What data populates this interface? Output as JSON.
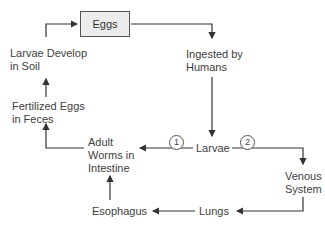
{
  "diagram": {
    "type": "life-cycle-flowchart",
    "nodes": {
      "eggs": "Eggs",
      "ingested_line1": "Ingested by",
      "ingested_line2": "Humans",
      "larvae": "Larvae",
      "venous_line1": "Venous",
      "venous_line2": "System",
      "lungs": "Lungs",
      "esophagus": "Esophagus",
      "adult_line1": "Adult",
      "adult_line2": "Worms in",
      "adult_line3": "Intestine",
      "fertilized_line1": "Fertilized Eggs",
      "fertilized_line2": "in Feces",
      "larvae_soil_line1": "Larvae Develop",
      "larvae_soil_line2": "in Soil"
    },
    "path_labels": {
      "path1": "1",
      "path2": "2"
    },
    "edges": [
      {
        "from": "Eggs",
        "to": "Ingested by Humans"
      },
      {
        "from": "Ingested by Humans",
        "to": "Larvae"
      },
      {
        "from": "Larvae",
        "to": "Adult Worms in Intestine",
        "label": "1"
      },
      {
        "from": "Larvae",
        "to": "Venous System",
        "label": "2"
      },
      {
        "from": "Venous System",
        "to": "Lungs"
      },
      {
        "from": "Lungs",
        "to": "Esophagus"
      },
      {
        "from": "Esophagus",
        "to": "Adult Worms in Intestine"
      },
      {
        "from": "Adult Worms in Intestine",
        "to": "Fertilized Eggs in Feces"
      },
      {
        "from": "Fertilized Eggs in Feces",
        "to": "Larvae Develop in Soil"
      },
      {
        "from": "Larvae Develop in Soil",
        "to": "Eggs"
      }
    ],
    "colors": {
      "box_fill": "#ececec",
      "line": "#333333",
      "text": "#404040"
    }
  }
}
